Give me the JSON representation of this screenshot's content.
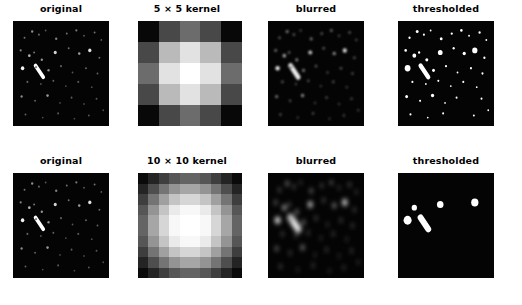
{
  "figure": {
    "background_color": "#ffffff",
    "width": 522,
    "height": 305,
    "rows": 2,
    "cols": 4
  },
  "rows": [
    {
      "name": "row-5x5",
      "panels": [
        {
          "name": "original",
          "title": "original",
          "type": "image"
        },
        {
          "name": "kernel",
          "title": "5 × 5 kernel",
          "type": "kernel"
        },
        {
          "name": "blurred",
          "title": "blurred",
          "type": "image"
        },
        {
          "name": "thresholded",
          "title": "thresholded",
          "type": "image"
        }
      ]
    },
    {
      "name": "row-10x10",
      "panels": [
        {
          "name": "original",
          "title": "original",
          "type": "image"
        },
        {
          "name": "kernel",
          "title": "10 × 10 kernel",
          "type": "kernel"
        },
        {
          "name": "blurred",
          "title": "blurred",
          "type": "image"
        },
        {
          "name": "thresholded",
          "title": "thresholded",
          "type": "image"
        }
      ]
    }
  ],
  "labels": {
    "r0c0": "original",
    "r0c1": "5 × 5 kernel",
    "r0c2": "blurred",
    "r0c3": "thresholded",
    "r1c0": "original",
    "r1c1": "10 × 10 kernel",
    "r1c2": "blurred",
    "r1c3": "thresholded"
  },
  "chart_data": {
    "type": "heatmap",
    "xlabel": "",
    "ylabel": "",
    "colormap": "gray",
    "panels_per_row": 4,
    "kernels": [
      {
        "name": "5 × 5 kernel",
        "size": 5,
        "vmin": 0,
        "vmax": 255,
        "separable_profile": [
          0,
          110,
          200,
          110,
          0
        ],
        "values": [
          [
            0,
            0,
            0,
            0,
            0
          ],
          [
            0,
            47,
            86,
            47,
            0
          ],
          [
            0,
            86,
            155,
            86,
            0
          ],
          [
            0,
            47,
            86,
            47,
            0
          ],
          [
            0,
            0,
            0,
            0,
            0
          ]
        ],
        "display_gray": [
          [
            8,
            72,
            108,
            72,
            8
          ],
          [
            72,
            186,
            226,
            186,
            72
          ],
          [
            108,
            226,
            255,
            226,
            108
          ],
          [
            72,
            186,
            226,
            186,
            72
          ],
          [
            8,
            72,
            108,
            72,
            8
          ]
        ]
      },
      {
        "name": "10 × 10 kernel",
        "size": 10,
        "vmin": 0,
        "vmax": 255,
        "separable_profile": [
          0,
          34,
          86,
          140,
          178,
          178,
          140,
          86,
          34,
          0
        ],
        "display_gray": [
          [
            10,
            36,
            62,
            86,
            100,
            100,
            86,
            62,
            36,
            10
          ],
          [
            36,
            78,
            116,
            148,
            166,
            166,
            148,
            116,
            78,
            36
          ],
          [
            62,
            116,
            160,
            196,
            214,
            214,
            196,
            160,
            116,
            62
          ],
          [
            86,
            148,
            196,
            234,
            248,
            248,
            234,
            196,
            148,
            86
          ],
          [
            100,
            166,
            214,
            248,
            255,
            255,
            248,
            214,
            166,
            100
          ],
          [
            100,
            166,
            214,
            248,
            255,
            255,
            248,
            214,
            166,
            100
          ],
          [
            86,
            148,
            196,
            234,
            248,
            248,
            234,
            196,
            148,
            86
          ],
          [
            62,
            116,
            160,
            196,
            214,
            214,
            196,
            160,
            116,
            62
          ],
          [
            36,
            78,
            116,
            148,
            166,
            166,
            148,
            116,
            78,
            36
          ],
          [
            10,
            36,
            62,
            86,
            100,
            100,
            86,
            62,
            36,
            10
          ]
        ]
      }
    ],
    "source_image": {
      "description": "astronomical star field, dark background with bright point sources and one elongated streak",
      "background_gray": 4,
      "sources": [
        {
          "x": 0.12,
          "y": 0.16,
          "r": 0.01,
          "i": 0.45
        },
        {
          "x": 0.2,
          "y": 0.1,
          "r": 0.012,
          "i": 0.55
        },
        {
          "x": 0.27,
          "y": 0.13,
          "r": 0.01,
          "i": 0.4
        },
        {
          "x": 0.34,
          "y": 0.09,
          "r": 0.009,
          "i": 0.35
        },
        {
          "x": 0.45,
          "y": 0.17,
          "r": 0.012,
          "i": 0.5
        },
        {
          "x": 0.56,
          "y": 0.12,
          "r": 0.01,
          "i": 0.42
        },
        {
          "x": 0.66,
          "y": 0.09,
          "r": 0.011,
          "i": 0.48
        },
        {
          "x": 0.74,
          "y": 0.14,
          "r": 0.009,
          "i": 0.36
        },
        {
          "x": 0.85,
          "y": 0.11,
          "r": 0.01,
          "i": 0.44
        },
        {
          "x": 0.92,
          "y": 0.18,
          "r": 0.009,
          "i": 0.38
        },
        {
          "x": 0.08,
          "y": 0.28,
          "r": 0.011,
          "i": 0.52
        },
        {
          "x": 0.17,
          "y": 0.33,
          "r": 0.014,
          "i": 0.7
        },
        {
          "x": 0.22,
          "y": 0.3,
          "r": 0.01,
          "i": 0.46
        },
        {
          "x": 0.3,
          "y": 0.37,
          "r": 0.012,
          "i": 0.58
        },
        {
          "x": 0.44,
          "y": 0.3,
          "r": 0.016,
          "i": 0.82
        },
        {
          "x": 0.58,
          "y": 0.26,
          "r": 0.01,
          "i": 0.44
        },
        {
          "x": 0.69,
          "y": 0.31,
          "r": 0.013,
          "i": 0.6
        },
        {
          "x": 0.8,
          "y": 0.28,
          "r": 0.017,
          "i": 0.88
        },
        {
          "x": 0.9,
          "y": 0.35,
          "r": 0.01,
          "i": 0.42
        },
        {
          "x": 0.1,
          "y": 0.45,
          "r": 0.018,
          "i": 0.95
        },
        {
          "x": 0.24,
          "y": 0.44,
          "r": 0.011,
          "i": 0.5
        },
        {
          "x": 0.37,
          "y": 0.47,
          "r": 0.012,
          "i": 0.55
        },
        {
          "x": 0.5,
          "y": 0.43,
          "r": 0.01,
          "i": 0.4
        },
        {
          "x": 0.62,
          "y": 0.49,
          "r": 0.009,
          "i": 0.34
        },
        {
          "x": 0.76,
          "y": 0.45,
          "r": 0.01,
          "i": 0.4
        },
        {
          "x": 0.88,
          "y": 0.5,
          "r": 0.01,
          "i": 0.38
        },
        {
          "x": 0.15,
          "y": 0.58,
          "r": 0.01,
          "i": 0.4
        },
        {
          "x": 0.29,
          "y": 0.6,
          "r": 0.009,
          "i": 0.33
        },
        {
          "x": 0.42,
          "y": 0.57,
          "r": 0.01,
          "i": 0.37
        },
        {
          "x": 0.55,
          "y": 0.62,
          "r": 0.009,
          "i": 0.32
        },
        {
          "x": 0.68,
          "y": 0.58,
          "r": 0.01,
          "i": 0.36
        },
        {
          "x": 0.82,
          "y": 0.63,
          "r": 0.009,
          "i": 0.31
        },
        {
          "x": 0.09,
          "y": 0.72,
          "r": 0.012,
          "i": 0.52
        },
        {
          "x": 0.23,
          "y": 0.76,
          "r": 0.01,
          "i": 0.38
        },
        {
          "x": 0.36,
          "y": 0.71,
          "r": 0.013,
          "i": 0.6
        },
        {
          "x": 0.49,
          "y": 0.78,
          "r": 0.009,
          "i": 0.3
        },
        {
          "x": 0.61,
          "y": 0.73,
          "r": 0.01,
          "i": 0.35
        },
        {
          "x": 0.74,
          "y": 0.79,
          "r": 0.009,
          "i": 0.29
        },
        {
          "x": 0.87,
          "y": 0.74,
          "r": 0.01,
          "i": 0.34
        },
        {
          "x": 0.13,
          "y": 0.89,
          "r": 0.01,
          "i": 0.38
        },
        {
          "x": 0.31,
          "y": 0.92,
          "r": 0.009,
          "i": 0.3
        },
        {
          "x": 0.47,
          "y": 0.88,
          "r": 0.01,
          "i": 0.34
        },
        {
          "x": 0.64,
          "y": 0.93,
          "r": 0.009,
          "i": 0.28
        },
        {
          "x": 0.79,
          "y": 0.9,
          "r": 0.01,
          "i": 0.33
        },
        {
          "x": 0.94,
          "y": 0.85,
          "r": 0.009,
          "i": 0.3
        }
      ],
      "streak": {
        "x1": 0.235,
        "y1": 0.425,
        "x2": 0.315,
        "y2": 0.535,
        "width": 0.038,
        "i": 1.0
      }
    },
    "threshold_level": 0.6
  }
}
